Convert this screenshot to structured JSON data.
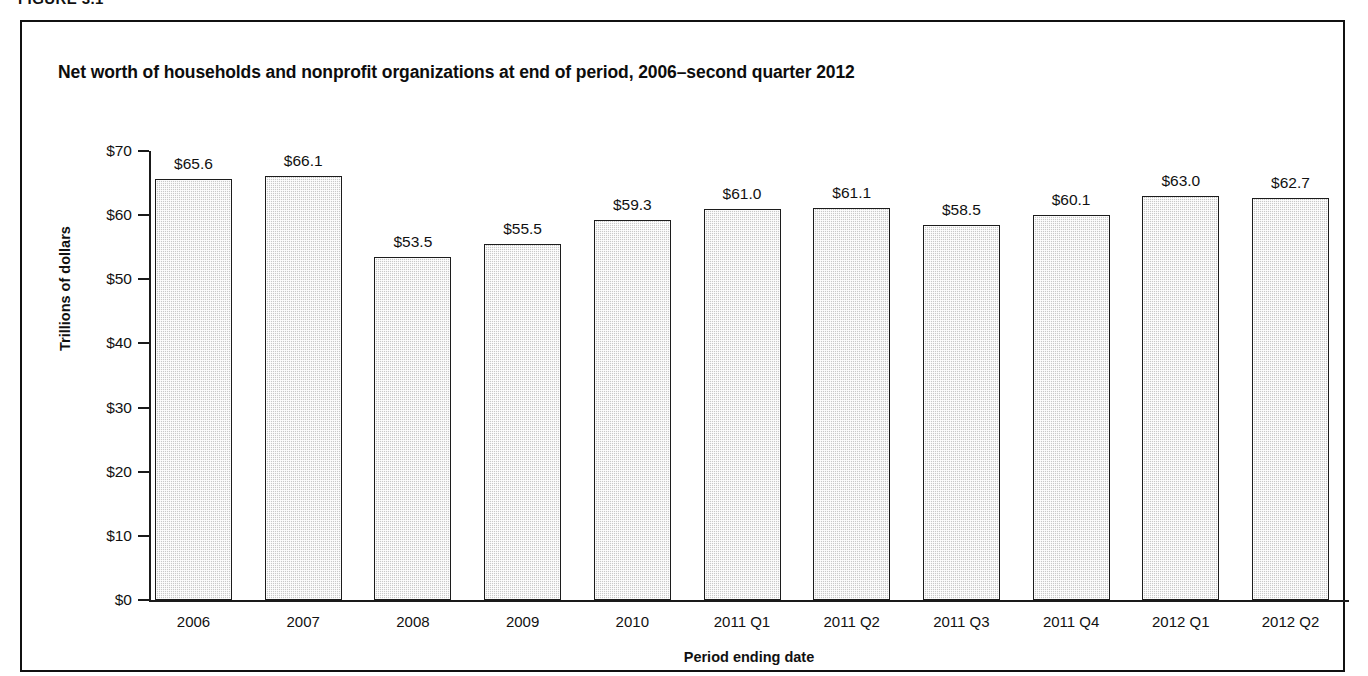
{
  "figure": {
    "label": "FIGURE 3.1",
    "title": "Net worth of households and nonprofit organizations at end of period, 2006–second quarter 2012",
    "caption_partial": ""
  },
  "chart_data": {
    "type": "bar",
    "title": "Net worth of households and nonprofit organizations at end of period, 2006–second quarter 2012",
    "xlabel": "Period ending date",
    "ylabel": "Trillions of dollars",
    "categories": [
      "2006",
      "2007",
      "2008",
      "2009",
      "2010",
      "2011 Q1",
      "2011 Q2",
      "2011 Q3",
      "2011 Q4",
      "2012 Q1",
      "2012 Q2"
    ],
    "values": [
      65.6,
      66.1,
      53.5,
      55.5,
      59.3,
      61.0,
      61.1,
      58.5,
      60.1,
      63.0,
      62.7
    ],
    "value_labels": [
      "$65.6",
      "$66.1",
      "$53.5",
      "$55.5",
      "$59.3",
      "$61.0",
      "$61.1",
      "$58.5",
      "$60.1",
      "$63.0",
      "$62.7"
    ],
    "ylim": [
      0,
      70
    ],
    "ytick_values": [
      0,
      10,
      20,
      30,
      40,
      50,
      60,
      70
    ],
    "ytick_labels": [
      "$0",
      "$10",
      "$20",
      "$30",
      "$40",
      "$50",
      "$60",
      "$70"
    ],
    "grid": false,
    "legend": null,
    "bar_fill_color": "#c9c9c9",
    "bar_border_color": "#1c1c1c",
    "axis_color": "#1a1a1a",
    "background_color": "#ffffff"
  }
}
